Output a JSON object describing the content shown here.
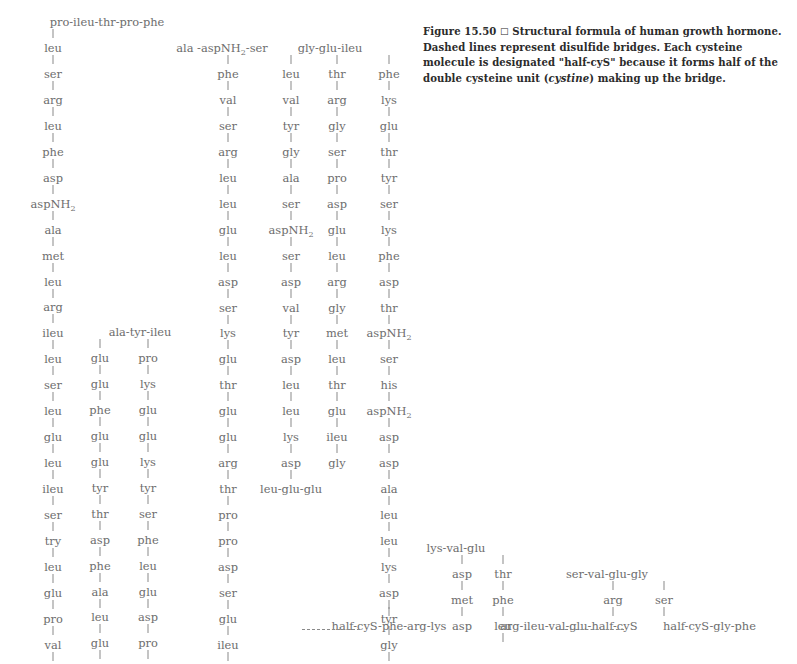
{
  "figure": {
    "caption_label": "Figure 15.50",
    "caption_square": "□",
    "caption_text_1": "Structural formula of human growth hormone. Dashed lines represent disulfide bridges. Each cysteine molecule is designated \"half-cyS\" because it forms half of the double cysteine unit (",
    "caption_italic": "cystine",
    "caption_text_2": ") making up the bridge.",
    "title": "Structural formula of human growth hormone"
  },
  "colors": {
    "text": "#6d6d6d",
    "caption": "#2b2b2b",
    "bond": "#8a8a8a",
    "background": "#ffffff"
  },
  "chains": {
    "header_1": "pro-ileu-thr-pro-phe",
    "header_2": "ala -aspNH2-ser",
    "header_3": "gly-glu-ileu",
    "header_4": "ala-tyr-ileu",
    "header_5": "lys-val-glu",
    "header_6": "ser-val-glu-gly",
    "footer_1": "his-arg-leu",
    "footer_2": "thr-ser-leu-half-cyS",
    "footer_3": "half-cyS-phe-arg-lys",
    "footer_4": "arg-ileu-val-glu-half-cyS",
    "footer_5": "half-cyS-gly-phe",
    "footer_6": "leu-glu-glu",
    "col1": [
      "leu",
      "ser",
      "arg",
      "leu",
      "phe",
      "asp",
      "aspNH2",
      "ala",
      "met",
      "leu",
      "arg",
      "ileu",
      "leu",
      "ser",
      "leu",
      "glu",
      "leu",
      "ileu",
      "ser",
      "try",
      "leu",
      "glu",
      "pro",
      "val",
      "glu",
      "phe",
      "ala"
    ],
    "col2": [
      "glu",
      "glu",
      "phe",
      "glu",
      "glu",
      "tyr",
      "thr",
      "asp",
      "phe",
      "ala",
      "leu",
      "glu",
      "his"
    ],
    "col3": [
      "pro",
      "lys",
      "glu",
      "glu",
      "lys",
      "tyr",
      "ser",
      "phe",
      "leu",
      "glu",
      "asp",
      "pro",
      "glu"
    ],
    "col4": [
      "phe",
      "val",
      "ser",
      "arg",
      "leu",
      "leu",
      "glu",
      "leu",
      "asp",
      "ser",
      "lys",
      "glu",
      "thr",
      "glu",
      "glu",
      "arg",
      "thr",
      "pro",
      "pro",
      "asp",
      "ser",
      "glu",
      "ileu",
      "ser",
      "ser",
      "phe"
    ],
    "col5": [
      "leu",
      "val",
      "tyr",
      "gly",
      "ala",
      "ser",
      "aspNH2",
      "ser",
      "asp",
      "val",
      "tyr",
      "asp",
      "leu",
      "leu",
      "lys",
      "asp"
    ],
    "col6": [
      "thr",
      "arg",
      "gly",
      "ser",
      "pro",
      "asp",
      "glu",
      "leu",
      "arg",
      "gly",
      "met",
      "leu",
      "thr",
      "glu",
      "ileu",
      "gly"
    ],
    "col7": [
      "phe",
      "lys",
      "glu",
      "thr",
      "tyr",
      "ser",
      "lys",
      "phe",
      "asp",
      "thr",
      "aspNH2",
      "ser",
      "his",
      "aspNH2",
      "asp",
      "asp",
      "ala",
      "leu",
      "leu",
      "lys",
      "asp",
      "tyr",
      "gly",
      "leu",
      "leu",
      "tyr"
    ],
    "col8": [
      "asp",
      "met",
      "asp"
    ],
    "col9": [
      "thr",
      "phe",
      "leu"
    ],
    "col10": [
      "arg"
    ],
    "col11": [
      "ser"
    ]
  }
}
